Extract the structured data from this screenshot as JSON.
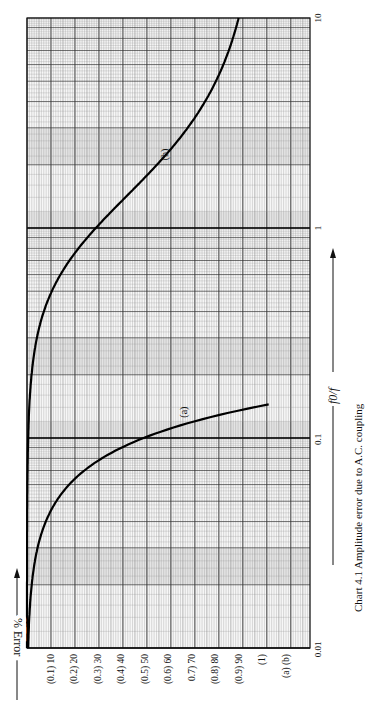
{
  "chart_data": {
    "type": "line",
    "title": "Chart 4.1 Amplitude error due to A.C. coupling",
    "xlabel": "f0/f",
    "ylabel": "% Error",
    "x_scale": "log",
    "xlim": [
      0.01,
      10
    ],
    "x_ticks": [
      "0.01",
      "0.1",
      "1",
      "10"
    ],
    "y_ticks": [
      "(0.1) 10",
      "(0.2) 20",
      "(0.3) 30",
      "(0.4) 40",
      "(0.5) 50",
      "(0.6) 60",
      "0.7) 70",
      "(0.8) 80",
      "(0.9) 90",
      "(1)",
      "(a) (b)"
    ],
    "y_scale_note": "Parenthesised values apply to curve (a) (0-1 %), plain values to curve (b) (0-100 %)",
    "grid": true,
    "orientation": "rotated 90 degrees counter-clockwise",
    "series": [
      {
        "name": "(a)",
        "x": [
          0.01,
          0.02,
          0.03,
          0.05,
          0.07,
          0.1,
          0.12,
          0.14,
          0.16
        ],
        "values": [
          0.005,
          0.02,
          0.045,
          0.12,
          0.24,
          0.49,
          0.71,
          0.96,
          1.0
        ]
      },
      {
        "name": "(b)",
        "x": [
          0.01,
          0.05,
          0.1,
          0.2,
          0.3,
          0.5,
          0.7,
          1,
          1.5,
          2,
          3,
          5,
          7,
          10
        ],
        "values": [
          0.005,
          0.12,
          0.5,
          1.9,
          4.2,
          10.6,
          18.1,
          29.3,
          44.5,
          55.3,
          68.4,
          80.4,
          85.9,
          90.0
        ]
      }
    ]
  },
  "labels": {
    "x_arrow": "f0/f",
    "y_arrow": "% Error",
    "caption": "Chart 4.1 Amplitude error due to A.C. coupling",
    "curve_a": "(a)",
    "curve_b": "(b)"
  }
}
